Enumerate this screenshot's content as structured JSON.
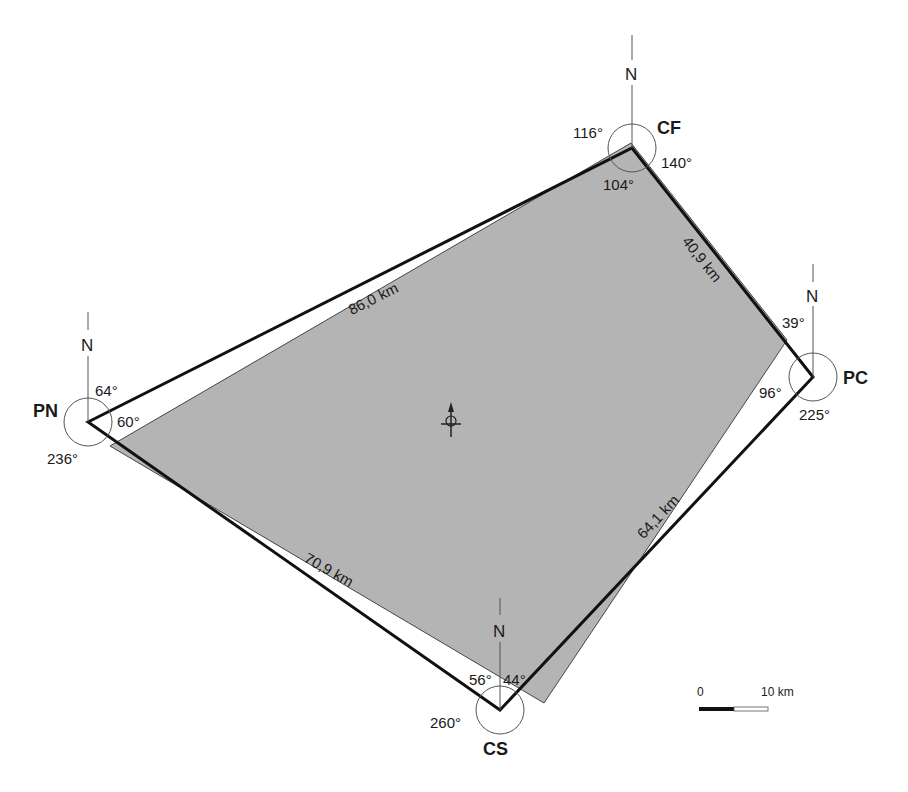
{
  "diagram": {
    "type": "triangulation-network",
    "colors": {
      "fill_polygon": "#b4b4b4",
      "stroke_outline": "#111111",
      "circle": "#555555",
      "background": "#ffffff"
    },
    "north_label": "N",
    "stations": [
      {
        "id": "CF",
        "label": "CF",
        "angles": {
          "left": "116°",
          "right": "140°",
          "inner": "104°"
        }
      },
      {
        "id": "PN",
        "label": "PN",
        "angles": {
          "top": "64°",
          "inner": "60°",
          "outer": "236°"
        }
      },
      {
        "id": "PC",
        "label": "PC",
        "angles": {
          "top": "39°",
          "inner": "96°",
          "outer": "225°"
        }
      },
      {
        "id": "CS",
        "label": "CS",
        "angles": {
          "left": "56°",
          "right": "44°",
          "outer": "260°"
        }
      }
    ],
    "edges": [
      {
        "from": "PN",
        "to": "CF",
        "length": "86,0 km"
      },
      {
        "from": "CF",
        "to": "PC",
        "length": "40,9 km"
      },
      {
        "from": "PC",
        "to": "CS",
        "length": "64,1 km"
      },
      {
        "from": "CS",
        "to": "PN",
        "length": "70,9 km"
      }
    ],
    "scale_bar": {
      "start": "0",
      "end": "10 km"
    },
    "centroid_marker": "centroid-crosshair-arrow"
  }
}
